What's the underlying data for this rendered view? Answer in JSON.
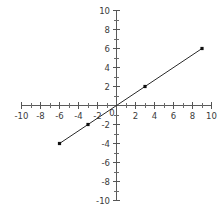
{
  "chart_data": {
    "type": "line",
    "title": "",
    "xlabel": "",
    "ylabel": "",
    "xlim": [
      -10,
      10
    ],
    "ylim": [
      -10,
      10
    ],
    "grid": false,
    "legend": null,
    "x_tick_labels": [
      "-10",
      "-8",
      "-6",
      "-4",
      "-2",
      "0",
      "2",
      "4",
      "6",
      "8",
      "10"
    ],
    "x_tick_values": [
      -10,
      -8,
      -6,
      -4,
      -2,
      0,
      2,
      4,
      6,
      8,
      10
    ],
    "y_tick_labels": [
      "10",
      "8",
      "6",
      "4",
      "2",
      "-2",
      "-4",
      "-6",
      "-8",
      "-10"
    ],
    "y_tick_values": [
      10,
      8,
      6,
      4,
      2,
      -2,
      -4,
      -6,
      -8,
      -10
    ],
    "minor_tick_step": 1,
    "origin_label": "0",
    "series": [
      {
        "name": "line",
        "slope": 0.6666666667,
        "intercept": 0,
        "line_endpoints": [
          [
            -6,
            -4
          ],
          [
            9,
            6
          ]
        ],
        "x": [
          -6,
          -3,
          3,
          9
        ],
        "y": [
          -4,
          -2,
          2,
          6
        ],
        "marker": "square",
        "color": "#111111"
      }
    ]
  },
  "colors": {
    "background": "#ffffff",
    "axis": "#5a5a5a",
    "tick": "#6a6a6a",
    "label": "#3b3b3b",
    "line": "#2b2b2b",
    "point": "#111111"
  }
}
